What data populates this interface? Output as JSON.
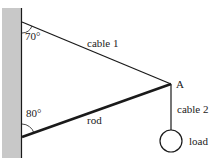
{
  "diagram": {
    "angles": {
      "top": "70°",
      "bottom": "80°"
    },
    "labels": {
      "cable1": "cable 1",
      "rod": "rod",
      "cable2": "cable 2",
      "point": "A",
      "load": "load"
    },
    "colors": {
      "wall_fill": "#c8c8c8",
      "line": "#1a1a1a"
    }
  }
}
